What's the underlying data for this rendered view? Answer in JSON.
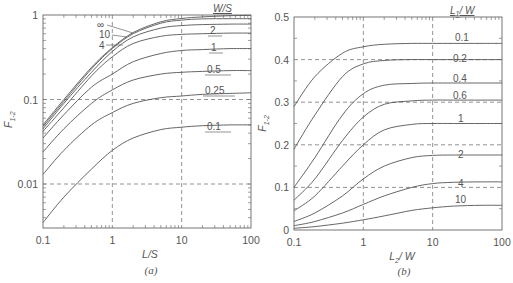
{
  "chart_data": [
    {
      "id": "a",
      "type": "line",
      "caption": "(a)",
      "title": "",
      "xlabel": "L/S",
      "ylabel": "F1-2",
      "xscale": "log",
      "yscale": "log",
      "xlim": [
        0.1,
        100
      ],
      "ylim": [
        0.003,
        1
      ],
      "xticks": [
        "0.1",
        "1",
        "10",
        "100"
      ],
      "yticks": [
        "0.01",
        "0.1",
        "1"
      ],
      "grid": "dashed at decades",
      "legend_title": "W/S",
      "x": [
        0.1,
        0.2,
        0.5,
        1,
        2,
        5,
        10,
        20,
        50,
        100
      ],
      "series": [
        {
          "name": "∞",
          "values": [
            0.05,
            0.1,
            0.24,
            0.41,
            0.62,
            0.83,
            0.91,
            0.95,
            0.98,
            0.99
          ]
        },
        {
          "name": "10",
          "values": [
            0.048,
            0.095,
            0.23,
            0.4,
            0.6,
            0.8,
            0.87,
            0.9,
            0.905,
            0.905
          ]
        },
        {
          "name": "4",
          "values": [
            0.045,
            0.09,
            0.21,
            0.37,
            0.55,
            0.7,
            0.75,
            0.77,
            0.78,
            0.78
          ]
        },
        {
          "name": "2",
          "values": [
            0.042,
            0.08,
            0.19,
            0.32,
            0.46,
            0.56,
            0.59,
            0.6,
            0.61,
            0.61
          ]
        },
        {
          "name": "1",
          "values": [
            0.035,
            0.066,
            0.14,
            0.2,
            0.28,
            0.35,
            0.38,
            0.39,
            0.4,
            0.4
          ]
        },
        {
          "name": "0.5",
          "values": [
            0.024,
            0.045,
            0.09,
            0.13,
            0.17,
            0.2,
            0.21,
            0.215,
            0.22,
            0.22
          ]
        },
        {
          "name": "0.25",
          "values": [
            0.013,
            0.025,
            0.05,
            0.07,
            0.09,
            0.105,
            0.11,
            0.115,
            0.118,
            0.12
          ]
        },
        {
          "name": "0.1",
          "values": [
            0.0035,
            0.007,
            0.015,
            0.025,
            0.035,
            0.044,
            0.047,
            0.049,
            0.05,
            0.05
          ]
        }
      ]
    },
    {
      "id": "b",
      "type": "line",
      "caption": "(b)",
      "title": "",
      "xlabel": "L2 / W",
      "ylabel": "F1-2",
      "xscale": "log",
      "yscale": "linear",
      "xlim": [
        0.1,
        100
      ],
      "ylim": [
        0,
        0.5
      ],
      "xticks": [
        "0.1",
        "1",
        "10",
        "100"
      ],
      "yticks": [
        "0",
        "0.1",
        "0.2",
        "0.3",
        "0.4",
        "0.5"
      ],
      "grid": "dashed at x decades and y=0.1..0.4",
      "legend_title": "L1 / W",
      "x": [
        0.1,
        0.2,
        0.5,
        1,
        2,
        5,
        10,
        20,
        50,
        100
      ],
      "series": [
        {
          "name": "0.1",
          "values": [
            0.29,
            0.36,
            0.415,
            0.43,
            0.436,
            0.438,
            0.438,
            0.438,
            0.438,
            0.438
          ]
        },
        {
          "name": "0.2",
          "values": [
            0.19,
            0.27,
            0.36,
            0.39,
            0.398,
            0.4,
            0.4,
            0.4,
            0.4,
            0.4
          ]
        },
        {
          "name": "0.4",
          "values": [
            0.1,
            0.17,
            0.27,
            0.32,
            0.34,
            0.344,
            0.345,
            0.345,
            0.345,
            0.345
          ]
        },
        {
          "name": "0.6",
          "values": [
            0.07,
            0.12,
            0.21,
            0.265,
            0.295,
            0.303,
            0.305,
            0.305,
            0.305,
            0.305
          ]
        },
        {
          "name": "1",
          "values": [
            0.045,
            0.08,
            0.15,
            0.2,
            0.235,
            0.248,
            0.25,
            0.25,
            0.25,
            0.25
          ]
        },
        {
          "name": "2",
          "values": [
            0.02,
            0.04,
            0.08,
            0.12,
            0.15,
            0.17,
            0.175,
            0.176,
            0.176,
            0.176
          ]
        },
        {
          "name": "4",
          "values": [
            0.01,
            0.02,
            0.04,
            0.06,
            0.08,
            0.1,
            0.109,
            0.112,
            0.113,
            0.113
          ]
        },
        {
          "name": "10",
          "values": [
            0.004,
            0.008,
            0.016,
            0.024,
            0.033,
            0.046,
            0.052,
            0.056,
            0.058,
            0.058
          ]
        }
      ]
    }
  ],
  "labels": {
    "a_caption": "(a)",
    "b_caption": "(b)",
    "a_xlabel": "L/S",
    "b_xlabel_main": "L",
    "b_xlabel_sub": "2",
    "b_xlabel_tail": "/ W",
    "ylabel_main": "F",
    "ylabel_sub": "1-2",
    "a_legend_title": "W/S",
    "b_legend_title_main": "L",
    "b_legend_title_sub": "1",
    "b_legend_title_tail": "/ W"
  }
}
